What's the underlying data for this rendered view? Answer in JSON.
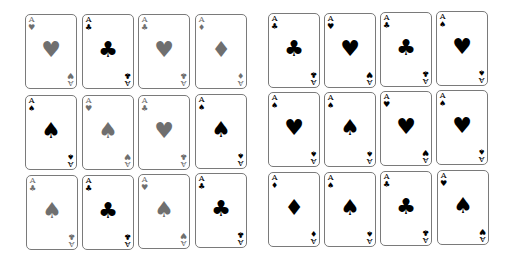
{
  "groups": [
    {
      "name": "left",
      "cards": [
        {
          "rank": "A",
          "corner": "♥",
          "center": "♥",
          "tone": "gray",
          "x": 25,
          "y": 14
        },
        {
          "rank": "A",
          "corner": "♣",
          "center": "♣",
          "tone": "black",
          "x": 82,
          "y": 14
        },
        {
          "rank": "A",
          "corner": "♣",
          "center": "♥",
          "tone": "gray",
          "x": 138,
          "y": 14
        },
        {
          "rank": "A",
          "corner": "♦",
          "center": "♦",
          "tone": "gray",
          "x": 195,
          "y": 14
        },
        {
          "rank": "A",
          "corner": "♠",
          "center": "♠",
          "tone": "black",
          "x": 25,
          "y": 95
        },
        {
          "rank": "A",
          "corner": "♥",
          "center": "♠",
          "tone": "gray",
          "x": 82,
          "y": 95
        },
        {
          "rank": "A",
          "corner": "♣",
          "center": "♥",
          "tone": "gray",
          "x": 138,
          "y": 95
        },
        {
          "rank": "A",
          "corner": "♠",
          "center": "♠",
          "tone": "black",
          "x": 195,
          "y": 94
        },
        {
          "rank": "A",
          "corner": "♣",
          "center": "♠",
          "tone": "gray",
          "x": 26,
          "y": 175
        },
        {
          "rank": "A",
          "corner": "♣",
          "center": "♣",
          "tone": "black",
          "x": 82,
          "y": 175
        },
        {
          "rank": "A",
          "corner": "♥",
          "center": "♠",
          "tone": "gray",
          "x": 138,
          "y": 174
        },
        {
          "rank": "A",
          "corner": "♣",
          "center": "♣",
          "tone": "black",
          "x": 195,
          "y": 173
        }
      ]
    },
    {
      "name": "right",
      "cards": [
        {
          "rank": "A",
          "corner": "♣",
          "center": "♣",
          "tone": "black",
          "x": 268,
          "y": 13
        },
        {
          "rank": "A",
          "corner": "♥",
          "center": "♥",
          "tone": "black",
          "x": 324,
          "y": 13
        },
        {
          "rank": "A",
          "corner": "♣",
          "center": "♣",
          "tone": "black",
          "x": 380,
          "y": 12
        },
        {
          "rank": "A",
          "corner": "♠",
          "center": "♥",
          "tone": "black",
          "x": 436,
          "y": 11
        },
        {
          "rank": "A",
          "corner": "♠",
          "center": "♥",
          "tone": "black",
          "x": 268,
          "y": 92
        },
        {
          "rank": "A",
          "corner": "♠",
          "center": "♠",
          "tone": "black",
          "x": 324,
          "y": 92
        },
        {
          "rank": "A",
          "corner": "♥",
          "center": "♥",
          "tone": "black",
          "x": 380,
          "y": 91
        },
        {
          "rank": "A",
          "corner": "♠",
          "center": "♥",
          "tone": "black",
          "x": 436,
          "y": 90
        },
        {
          "rank": "A",
          "corner": "♦",
          "center": "♦",
          "tone": "black",
          "x": 268,
          "y": 172
        },
        {
          "rank": "A",
          "corner": "♠",
          "center": "♠",
          "tone": "black",
          "x": 324,
          "y": 172
        },
        {
          "rank": "A",
          "corner": "♣",
          "center": "♣",
          "tone": "black",
          "x": 380,
          "y": 171
        },
        {
          "rank": "A",
          "corner": "♥",
          "center": "♠",
          "tone": "black",
          "x": 437,
          "y": 170
        }
      ]
    }
  ]
}
